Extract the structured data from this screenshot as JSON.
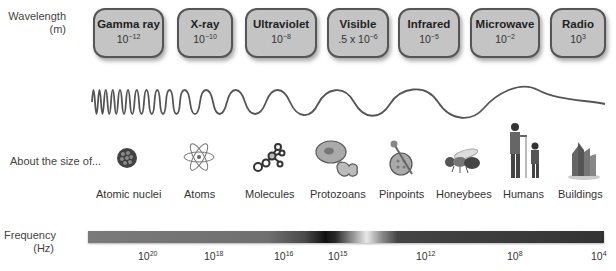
{
  "labels": {
    "wavelength_line1": "Wavelength",
    "wavelength_line2": "(m)",
    "size_of": "About the size of...",
    "frequency_line1": "Frequency",
    "frequency_line2": "(Hz)"
  },
  "bands": [
    {
      "name": "Gamma ray",
      "base": "10",
      "exp": "−12",
      "prefix": ""
    },
    {
      "name": "X-ray",
      "base": "10",
      "exp": "−10",
      "prefix": ""
    },
    {
      "name": "Ultraviolet",
      "base": "10",
      "exp": "−8",
      "prefix": ""
    },
    {
      "name": "Visible",
      "base": "10",
      "exp": "−6",
      "prefix": ".5 x "
    },
    {
      "name": "Infrared",
      "base": "10",
      "exp": "−5",
      "prefix": ""
    },
    {
      "name": "Microwave",
      "base": "10",
      "exp": "−2",
      "prefix": ""
    },
    {
      "name": "Radio",
      "base": "10",
      "exp": "3",
      "prefix": ""
    }
  ],
  "sizes": [
    {
      "label": "Atomic nuclei",
      "icon": "atomic-nucleus-icon"
    },
    {
      "label": "Atoms",
      "icon": "atom-icon"
    },
    {
      "label": "Molecules",
      "icon": "molecule-icon"
    },
    {
      "label": "Protozoans",
      "icon": "protozoan-icon"
    },
    {
      "label": "Pinpoints",
      "icon": "pinpoint-icon"
    },
    {
      "label": "Honeybees",
      "icon": "honeybee-icon"
    },
    {
      "label": "Humans",
      "icon": "humans-icon"
    },
    {
      "label": "Buildings",
      "icon": "buildings-icon"
    }
  ],
  "frequency_ticks": [
    {
      "base": "10",
      "exp": "20"
    },
    {
      "base": "10",
      "exp": "18"
    },
    {
      "base": "10",
      "exp": "16"
    },
    {
      "base": "10",
      "exp": "15"
    },
    {
      "base": "10",
      "exp": "12"
    },
    {
      "base": "10",
      "exp": "8"
    },
    {
      "base": "10",
      "exp": "4"
    }
  ],
  "colors": {
    "box_fill": "#c4c4c4",
    "box_border": "#555555",
    "wave": "#555555"
  }
}
